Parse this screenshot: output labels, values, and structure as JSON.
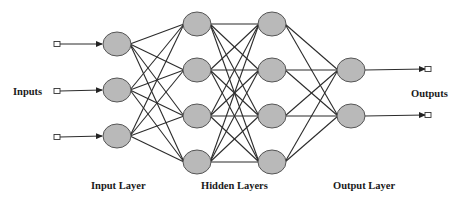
{
  "diagram": {
    "type": "feed-forward neural network",
    "labels": {
      "inputs": "Inputs",
      "outputs": "Outputs",
      "input_layer": "Input Layer",
      "hidden_layers": "Hidden Layers",
      "output_layer": "Output Layer"
    },
    "colors": {
      "node_fill": "#b9b9b9",
      "node_stroke": "#555555",
      "edge": "#2b2b2b",
      "text": "#1a1a1a",
      "background": "#ffffff"
    },
    "layers": [
      {
        "name": "input",
        "x": 117,
        "nodes_y": [
          44,
          90,
          136
        ]
      },
      {
        "name": "hidden-1",
        "x": 197,
        "nodes_y": [
          24,
          70,
          116,
          162
        ]
      },
      {
        "name": "hidden-2",
        "x": 272,
        "nodes_y": [
          24,
          70,
          116,
          162
        ]
      },
      {
        "name": "output",
        "x": 351,
        "nodes_y": [
          70,
          116
        ]
      }
    ],
    "node_size": {
      "rx": 14,
      "ry": 12
    },
    "inputs": {
      "box_x": 57,
      "y": [
        44,
        91,
        137
      ]
    },
    "outputs": {
      "box_x": 428,
      "y": [
        69,
        115
      ]
    },
    "connectivity": "fully-connected between adjacent layers"
  }
}
